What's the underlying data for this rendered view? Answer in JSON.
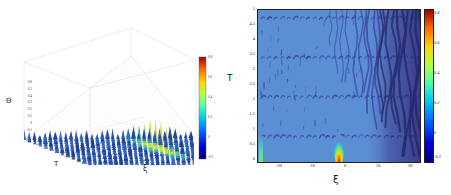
{
  "figure": {
    "type": "two-panel-scientific-figure",
    "background_color": "#ffffff"
  },
  "panel_left": {
    "name": "3d-surface-plot",
    "z_axis_label": "Θ",
    "x_axis_label": "ξ",
    "y_axis_label": "T",
    "z_ticks": [
      "0.6",
      "0.5",
      "0.4",
      "0.3",
      "0.2",
      "0.1",
      "0",
      "-0.1",
      "-0.2"
    ],
    "t_ticks": [
      "5",
      "4",
      "3",
      "2",
      "1",
      "0"
    ],
    "xi_ticks": [
      "-20",
      "-10",
      "0",
      "10",
      "20"
    ],
    "colorbar": {
      "ticks": [
        "0.8",
        "0.6",
        "0.4",
        "0.2",
        "0",
        "-0.2"
      ],
      "min": -0.2,
      "max": 0.8
    }
  },
  "panel_right": {
    "name": "2d-density-heatmap",
    "x_axis_label": "ξ",
    "y_axis_label": "T",
    "x_ticks": [
      "-20",
      "-10",
      "0",
      "10",
      "20"
    ],
    "y_ticks": [
      "0",
      "0.5",
      "1",
      "1.5",
      "2",
      "2.5",
      "3",
      "3.5",
      "4",
      "4.5",
      "5"
    ],
    "colorbar": {
      "ticks": [
        "0.8",
        "0.6",
        "0.4",
        "0.2",
        "0",
        "-0.2"
      ],
      "min": -0.2,
      "max": 0.8
    }
  },
  "chart_data": {
    "type": "heatmap",
    "title": "",
    "xlabel": "ξ",
    "ylabel": "T",
    "xlim": [
      -25,
      25
    ],
    "ylim": [
      0,
      5
    ],
    "zlim": [
      -0.2,
      0.8
    ],
    "colormap": "jet",
    "grid": false,
    "legend": "colorbar-right",
    "background_value": 0.02,
    "background_color": "#5b8fd4",
    "dark_region_color": "#3b3b8c",
    "filament_color": "#3a3f9e",
    "peak_core_color": "#d8361a",
    "horizontal_streak_rows_T": [
      0.85,
      2.15,
      3.45,
      4.75
    ],
    "bright_peak": {
      "xi": 0,
      "T": 0.12,
      "value": 0.8
    },
    "left_edge_feature": {
      "xi": -24.5,
      "T": 0.35,
      "value": 0.35
    },
    "dark_band_onset_xi": 12,
    "colorbar_ticks": [
      -0.2,
      0,
      0.2,
      0.4,
      0.6,
      0.8
    ],
    "colorbar_tick_labels": [
      "-0.2",
      "0",
      "0.2",
      "0.4",
      "0.6",
      "0.8"
    ],
    "x_tick_values": [
      -20,
      -10,
      0,
      10,
      20
    ],
    "y_tick_values": [
      0,
      0.5,
      1,
      1.5,
      2,
      2.5,
      3,
      3.5,
      4,
      4.5,
      5
    ],
    "panels": [
      {
        "type": "surface3d",
        "xlabel": "ξ",
        "ylabel": "T",
        "zlabel": "Θ",
        "zlim": [
          -0.2,
          0.6
        ],
        "description": "Same field rendered as a 3D surface of densely packed blue spikes with a green-yellow elevated peak near ξ ≈ 0."
      }
    ]
  }
}
